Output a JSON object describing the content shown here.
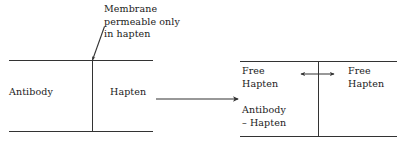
{
  "figure": {
    "type": "diagram",
    "background_color": "#ffffff",
    "line_color": "#333333",
    "text_color": "#1a1a1a"
  },
  "annotation": {
    "membrane_callout": "Membrane\npermeable only\nin hapten",
    "callout_line_1": "Membrane",
    "callout_line_2": "permeable only",
    "callout_line_3": "in hapten"
  },
  "left_cell": {
    "left_compartment_label": "Antibody",
    "right_compartment_label": "Hapten"
  },
  "transition": {
    "arrow": "right-arrow",
    "label": ""
  },
  "right_cell": {
    "left_compartment_line_1": "Free",
    "left_compartment_line_2": "Hapten",
    "left_compartment_complex_line_1": "Antibody",
    "left_compartment_complex_line_2": "– Hapten",
    "right_compartment_line_1": "Free",
    "right_compartment_line_2": "Hapten",
    "equilibrium_arrow": "double-headed-arrow"
  }
}
